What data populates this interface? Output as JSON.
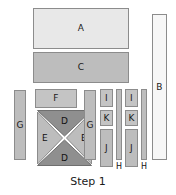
{
  "figure": {
    "caption": "Step 1",
    "background_color": "#ffffff",
    "outline_color": "#8c8c8c",
    "text_color": "#1a1a1a"
  },
  "parts": {
    "a": {
      "label": "A",
      "fill": "#e8e8e8"
    },
    "b": {
      "label": "B",
      "fill": "#f7f7f7"
    },
    "c": {
      "label": "C",
      "fill": "#bdbdbd"
    },
    "d_top": {
      "label": "D",
      "fill": "#8f8f8f"
    },
    "d_bottom": {
      "label": "D",
      "fill": "#8f8f8f"
    },
    "e_left": {
      "label": "E",
      "fill": "#bdbdbd"
    },
    "e_right": {
      "label": "E",
      "fill": "#bdbdbd"
    },
    "f": {
      "label": "F",
      "fill": "#c4c4c4"
    },
    "g_left": {
      "label": "G",
      "fill": "#bdbdbd"
    },
    "g_right": {
      "label": "G",
      "fill": "#bdbdbd"
    },
    "h_left": {
      "label": "H",
      "fill": "#bdbdbd"
    },
    "h_right": {
      "label": "H",
      "fill": "#bdbdbd"
    },
    "i_left": {
      "label": "I",
      "fill": "#c4c4c4"
    },
    "i_right": {
      "label": "I",
      "fill": "#c4c4c4"
    },
    "j_left": {
      "label": "J",
      "fill": "#bdbdbd"
    },
    "j_right": {
      "label": "J",
      "fill": "#bdbdbd"
    },
    "k_left": {
      "label": "K",
      "fill": "#c4c4c4"
    },
    "k_right": {
      "label": "K",
      "fill": "#c4c4c4"
    }
  }
}
